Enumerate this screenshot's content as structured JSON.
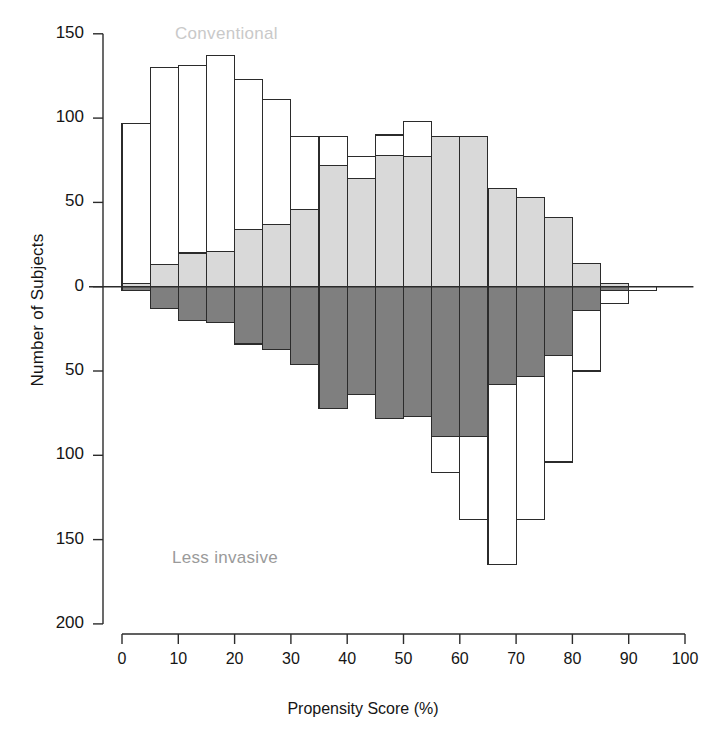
{
  "chart_data": {
    "type": "bar",
    "subtype": "back-to-back mirrored histogram (population pyramid)",
    "title": "",
    "xlabel": "Propensity Score (%)",
    "ylabel": "Number of Subjects",
    "xlim": [
      0,
      100
    ],
    "ylim": [
      -200,
      150
    ],
    "grid": false,
    "legend_position": "inside-plot",
    "bin_width": 5,
    "bin_starts": [
      0,
      5,
      10,
      15,
      20,
      25,
      30,
      35,
      40,
      45,
      50,
      55,
      60,
      65,
      70,
      75,
      80,
      85,
      90
    ],
    "x_ticks": [
      0,
      10,
      20,
      30,
      40,
      50,
      60,
      70,
      80,
      90,
      100
    ],
    "x_tick_labels": [
      "0",
      "10",
      "20",
      "30",
      "40",
      "50",
      "60",
      "70",
      "80",
      "90",
      "100"
    ],
    "y_ticks": [
      150,
      100,
      50,
      0,
      -50,
      -100,
      -150,
      -200
    ],
    "y_tick_labels": [
      "150",
      "100",
      "50",
      "0",
      "50",
      "100",
      "150",
      "200"
    ],
    "series": [
      {
        "name": "Conventional",
        "direction": "up",
        "annotation": "Conventional",
        "annotation_color": "#c9c9c9",
        "total_outline_label": "total (unmatched) cohort, open bars",
        "matched_label": "matched subjects, shaded bars",
        "values_total": [
          97,
          130,
          131,
          137,
          123,
          111,
          89,
          89,
          77,
          90,
          98,
          89,
          58,
          53,
          41,
          14,
          6,
          2,
          0
        ],
        "values_matched": [
          2,
          13,
          20,
          21,
          34,
          37,
          46,
          72,
          64,
          78,
          77,
          89,
          89,
          58,
          53,
          41,
          14,
          2,
          0
        ]
      },
      {
        "name": "Less invasive",
        "direction": "down",
        "annotation": "Less invasive",
        "annotation_color": "#9a9a9a",
        "values_total": [
          2,
          13,
          20,
          21,
          34,
          37,
          46,
          72,
          64,
          78,
          77,
          110,
          138,
          165,
          138,
          104,
          50,
          10,
          2
        ],
        "values_matched": [
          2,
          13,
          20,
          21,
          34,
          37,
          46,
          72,
          64,
          78,
          77,
          89,
          89,
          58,
          53,
          41,
          14,
          2,
          0
        ]
      }
    ],
    "colors": {
      "outline": "#2b2b2b",
      "conventional_fill": "#d9d9d9",
      "less_invasive_fill": "#7f7f7f",
      "open_fill": "#ffffff",
      "axis": "#2b2b2b",
      "text": "#151515"
    }
  },
  "axes": {
    "y_title": "Number of Subjects",
    "x_title": "Propensity Score (%)"
  },
  "labels": {
    "conventional": "Conventional",
    "less_invasive": "Less invasive"
  }
}
